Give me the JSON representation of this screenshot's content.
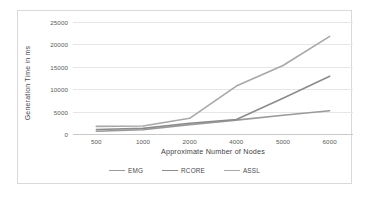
{
  "chart_data": {
    "type": "line",
    "title": "",
    "xlabel": "Approximate Number of Nodes",
    "ylabel": "Generation Time in ms",
    "categories": [
      "500",
      "1000",
      "2000",
      "4000",
      "5000",
      "6000"
    ],
    "xtick_labels": [
      "500",
      "1000",
      "2000",
      "4000",
      "5000",
      "6000"
    ],
    "ytick_labels": [
      "0",
      "5000",
      "10000",
      "15000",
      "20000",
      "25000"
    ],
    "ylim": [
      0,
      25000
    ],
    "ytick_values": [
      0,
      5000,
      10000,
      15000,
      20000,
      25000
    ],
    "grid": "horizontal",
    "legend_position": "bottom",
    "series": [
      {
        "name": "EMG",
        "color": "#9a9a9a",
        "values": [
          600,
          950,
          2100,
          3100,
          4200,
          5200
        ]
      },
      {
        "name": "RCORE",
        "color": "#8c8c8c",
        "values": [
          1000,
          1250,
          2400,
          3250,
          8000,
          12900
        ]
      },
      {
        "name": "ASSL",
        "color": "#a8a8a8",
        "values": [
          1700,
          1800,
          3500,
          10700,
          15300,
          21800
        ]
      }
    ]
  },
  "legend": {
    "items": [
      {
        "label": "EMG",
        "color": "#9a9a9a"
      },
      {
        "label": "RCORE",
        "color": "#8c8c8c"
      },
      {
        "label": "ASSL",
        "color": "#a8a8a8"
      }
    ]
  },
  "colors": {
    "frame_border": "#d9d9d9",
    "gridline": "#e6e6e6",
    "axis_text": "#5a5a5a",
    "label_text": "#3f3f3f",
    "background": "#ffffff"
  }
}
